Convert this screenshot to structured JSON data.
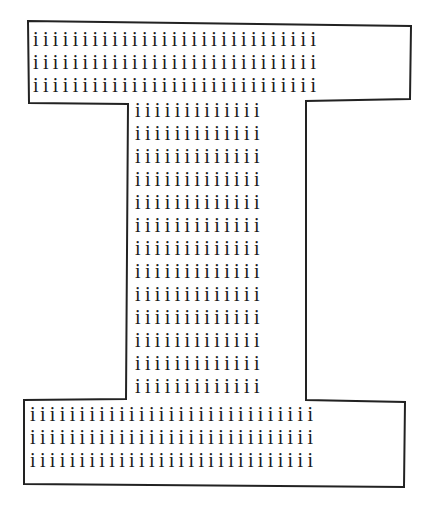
{
  "figure": {
    "glyph": "i",
    "outline_color": "#222222",
    "text_color": "#1a1a1a"
  },
  "top_block": {
    "rows": [
      "iiiiiiiiiiiiiiiiiiiiiiiiiiiii",
      "iiiiiiiiiiiiiiiiiiiiiiiiiiiii",
      "iiiiiiiiiiiiiiiiiiiiiiiiiiiii"
    ]
  },
  "stem": {
    "rows": [
      "iiiiiiiiiiiii",
      "iiiiiiiiiiiii",
      "iiiiiiiiiiiii",
      "iiiiiiiiiiiii",
      "iiiiiiiiiiiii",
      "iiiiiiiiiiiii",
      "iiiiiiiiiiiii",
      "iiiiiiiiiiiii",
      "iiiiiiiiiiiii",
      "iiiiiiiiiiiii",
      "iiiiiiiiiiiii",
      "iiiiiiiiiiiii",
      "iiiiiiiiiiiii"
    ]
  },
  "bottom_block": {
    "rows": [
      "iiiiiiiiiiiiiiiiiiiiiiiiiiiii",
      "iiiiiiiiiiiiiiiiiiiiiiiiiiiii",
      "iiiiiiiiiiiiiiiiiiiiiiiiiiiii"
    ]
  }
}
